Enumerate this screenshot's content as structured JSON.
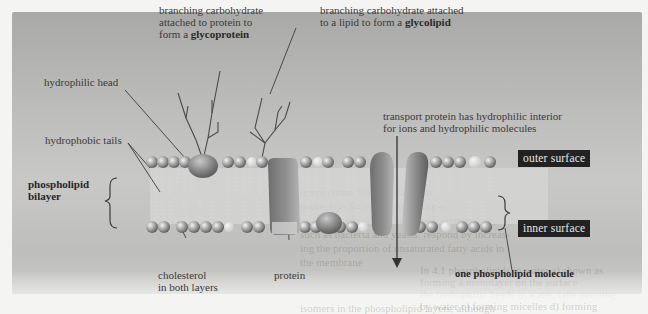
{
  "figure": {
    "labels": {
      "glycoprotein": [
        "branching carbohydrate",
        "attached to protein to",
        "form a ",
        "glycoprotein"
      ],
      "glycolipid": [
        "branching carbohydrate attached",
        "to a lipid to form a ",
        "glycolipid"
      ],
      "hydrophilic_head": "hydrophilic head",
      "hydrophobic_tails": "hydrophobic tails",
      "bilayer": [
        "phospholipid",
        "bilayer"
      ],
      "transport_protein": [
        "transport protein has hydrophilic interior",
        "for ions and hydrophilic molecules"
      ],
      "outer_surface": "outer surface",
      "inner_surface": "inner surface",
      "cholesterol": [
        "cholesterol",
        "in both layers"
      ],
      "protein": "protein",
      "one_phospholipid": "one phospholipid molecule"
    },
    "background_text": [
      "temperature. Some desaturase",
      "make. It is found that some organ",
      "which cannot control their own temperature,",
      "such as bacteria and yeasts, respond by increas-",
      "ing the proportion of unsaturated fatty acids in",
      "the membrane",
      "In 4.1 phospholipids in water  a) shown as",
      "forming a monolayer on the surface",
      "the hydrophilic heads in water, tails pointing",
      "by water  c) forming micelles  d) forming",
      "isomers in the phospholipid layers, although"
    ],
    "colors": {
      "panel": "#bdbdbb",
      "tag_bg": "#222222",
      "tag_text": "#e8e8e8",
      "label_text": "#3a3a3a"
    }
  }
}
